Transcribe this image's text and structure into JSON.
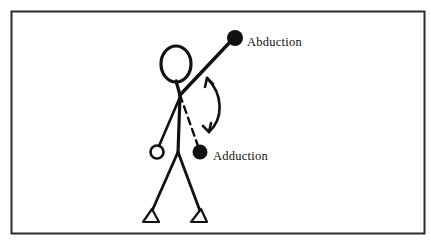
{
  "figure": {
    "name": "shoulder-abduction-adduction-diagram",
    "background_color": "#ffffff",
    "ink_color": "#111111",
    "border": {
      "name": "figure-border",
      "x": 11,
      "y": 11,
      "width": 414,
      "height": 223,
      "stroke_width": 2,
      "color": "#2b2b2b"
    },
    "labels": {
      "abduction": "Abduction",
      "adduction": "Adduction"
    },
    "caption_fragment": "",
    "stick_figure": {
      "head": {
        "cx": 176,
        "cy": 64,
        "rx": 15,
        "ry": 18
      },
      "neck": {
        "x1": 176,
        "y1": 82,
        "x2": 180,
        "y2": 95
      },
      "shoulder": {
        "x": 180,
        "y": 95
      },
      "spine": {
        "x1": 180,
        "y1": 95,
        "x2": 178,
        "y2": 152
      },
      "hip": {
        "x": 178,
        "y": 152
      },
      "left_arm": {
        "x1": 180,
        "y1": 97,
        "x2": 158,
        "y2": 147
      },
      "left_hand": {
        "cx": 157,
        "cy": 152,
        "r": 6,
        "filled": false
      },
      "abducted_arm": {
        "x1": 180,
        "y1": 95,
        "x2": 231,
        "y2": 41
      },
      "abducted_hand": {
        "cx": 235,
        "cy": 38,
        "r": 8,
        "filled": true
      },
      "adducted_arm_dashed": {
        "x1": 180,
        "y1": 95,
        "x2": 198,
        "y2": 147
      },
      "adducted_hand": {
        "cx": 200,
        "cy": 152,
        "r": 7,
        "filled": true
      },
      "right_leg": {
        "x1": 178,
        "y1": 152,
        "x2": 200,
        "y2": 210
      },
      "left_leg": {
        "x1": 178,
        "y1": 152,
        "x2": 152,
        "y2": 210
      },
      "right_foot": {
        "points": "200,210 207,221 192,221"
      },
      "left_foot": {
        "points": "152,210 159,221 144,221"
      }
    },
    "range_of_motion_arrow": {
      "name": "range-of-motion-double-arrow",
      "path": "M 205 75 C 222 92, 224 118, 207 134",
      "double_headed": true
    },
    "label_positions": {
      "abduction": {
        "x": 247,
        "y": 43
      },
      "adduction": {
        "x": 213,
        "y": 157
      }
    }
  }
}
